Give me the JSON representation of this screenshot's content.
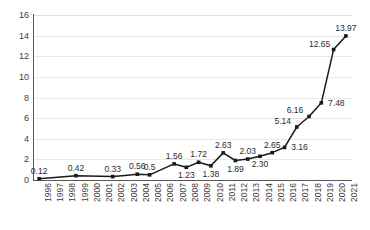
{
  "chart_data": {
    "type": "line",
    "title": "",
    "subtitle": "",
    "xlabel": "",
    "ylabel": "",
    "categories": [
      "1996",
      "1997",
      "1998",
      "1999",
      "2000",
      "2001",
      "2002",
      "2003",
      "2004",
      "2005",
      "2006",
      "2007",
      "2008",
      "2009",
      "2010",
      "2011",
      "2012",
      "2013",
      "2014",
      "2015",
      "2016",
      "2017",
      "2018",
      "2019",
      "2020",
      "2021"
    ],
    "x_tick_labels": [
      "1996",
      "1997",
      "1998",
      "1999",
      "2000",
      "2001",
      "2002",
      "2003",
      "2004",
      "2005",
      "2006",
      "2007",
      "2008",
      "2009",
      "2010",
      "2011",
      "2012",
      "2013",
      "2014",
      "2015",
      "2016",
      "2017",
      "2018",
      "2019",
      "2020",
      "2021"
    ],
    "y_tick_labels": [
      "0",
      "2",
      "4",
      "6",
      "8",
      "10",
      "12",
      "14",
      "16"
    ],
    "y_ticks": [
      0,
      2,
      4,
      6,
      8,
      10,
      12,
      14,
      16
    ],
    "ylim": [
      0,
      16
    ],
    "grid": true,
    "legend": false,
    "legend_position": "none",
    "data_labels_visible": true,
    "series": [
      {
        "name": "series-1",
        "color": "#1a1a1a",
        "marker": "square",
        "points": [
          {
            "x": "1996",
            "y": 0.12,
            "label": "0.12",
            "label_pos": "above"
          },
          {
            "x": "1997",
            "y": 0.22,
            "label": "",
            "label_pos": "none"
          },
          {
            "x": "1998",
            "y": 0.32,
            "label": "",
            "label_pos": "none"
          },
          {
            "x": "1999",
            "y": 0.42,
            "label": "0.42",
            "label_pos": "above"
          },
          {
            "x": "2000",
            "y": 0.39,
            "label": "",
            "label_pos": "none"
          },
          {
            "x": "2001",
            "y": 0.36,
            "label": "",
            "label_pos": "none"
          },
          {
            "x": "2002",
            "y": 0.33,
            "label": "0.33",
            "label_pos": "above"
          },
          {
            "x": "2003",
            "y": 0.44,
            "label": "",
            "label_pos": "none"
          },
          {
            "x": "2004",
            "y": 0.56,
            "label": "0.56",
            "label_pos": "above"
          },
          {
            "x": "2005",
            "y": 0.5,
            "label": "0.5",
            "label_pos": "above"
          },
          {
            "x": "2006",
            "y": 1.03,
            "label": "",
            "label_pos": "none"
          },
          {
            "x": "2007",
            "y": 1.56,
            "label": "1.56",
            "label_pos": "above"
          },
          {
            "x": "2008",
            "y": 1.23,
            "label": "1.23",
            "label_pos": "below"
          },
          {
            "x": "2009",
            "y": 1.72,
            "label": "1.72",
            "label_pos": "above"
          },
          {
            "x": "2010",
            "y": 1.38,
            "label": "1.38",
            "label_pos": "below"
          },
          {
            "x": "2011",
            "y": 2.63,
            "label": "2.63",
            "label_pos": "above"
          },
          {
            "x": "2012",
            "y": 1.89,
            "label": "1.89",
            "label_pos": "below"
          },
          {
            "x": "2013",
            "y": 2.03,
            "label": "2.03",
            "label_pos": "above"
          },
          {
            "x": "2014",
            "y": 2.3,
            "label": "2.30",
            "label_pos": "below"
          },
          {
            "x": "2015",
            "y": 2.65,
            "label": "2.65",
            "label_pos": "above"
          },
          {
            "x": "2016",
            "y": 3.16,
            "label": "3.16",
            "label_pos": "right"
          },
          {
            "x": "2017",
            "y": 5.14,
            "label": "5.14",
            "label_pos": "left"
          },
          {
            "x": "2018",
            "y": 6.16,
            "label": "6.16",
            "label_pos": "left"
          },
          {
            "x": "2019",
            "y": 7.48,
            "label": "7.48",
            "label_pos": "right"
          },
          {
            "x": "2020",
            "y": 12.65,
            "label": "12.65",
            "label_pos": "left"
          },
          {
            "x": "2021",
            "y": 13.97,
            "label": "13.97",
            "label_pos": "above"
          }
        ]
      }
    ]
  }
}
